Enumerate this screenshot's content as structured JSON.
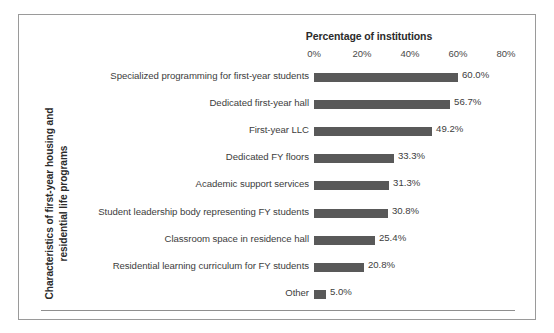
{
  "chart_data": {
    "type": "bar",
    "orientation": "horizontal",
    "title": "",
    "xlabel": "Percentage of institutions",
    "ylabel": "Characteristics of first-year housing and residential life programs",
    "ylabel_lines": [
      "Characteristics of first-year housing and",
      "residential life programs"
    ],
    "xlim": [
      0,
      80
    ],
    "x_ticks": [
      0,
      20,
      40,
      60,
      80
    ],
    "x_tick_labels": [
      "0%",
      "20%",
      "40%",
      "60%",
      "80%"
    ],
    "grid": false,
    "legend": false,
    "bar_color": "#595959",
    "categories": [
      "Specialized programming for first-year students",
      "Dedicated first-year hall",
      "First-year LLC",
      "Dedicated FY floors",
      "Academic support services",
      "Student leadership body representing FY students",
      "Classroom space in residence hall",
      "Residential learning curriculum for FY students",
      "Other"
    ],
    "values": [
      60.0,
      56.7,
      49.2,
      33.3,
      31.3,
      30.8,
      25.4,
      20.8,
      5.0
    ],
    "data_labels": [
      "60.0%",
      "56.7%",
      "49.2%",
      "33.3%",
      "31.3%",
      "30.8%",
      "25.4%",
      "20.8%",
      "5.0%"
    ]
  }
}
